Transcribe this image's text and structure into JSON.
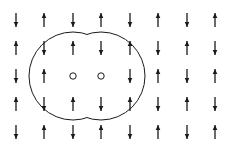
{
  "diagram": {
    "rows": 5,
    "cols": 8,
    "grid": [
      [
        "down",
        "up",
        "down",
        "up",
        "down",
        "up",
        "down",
        "up"
      ],
      [
        "up",
        "down",
        "up",
        "down",
        "up",
        "down",
        "up",
        "down"
      ],
      [
        "down",
        "up",
        "hole",
        "hole",
        "down",
        "up",
        "down",
        "up"
      ],
      [
        "up",
        "down",
        "up",
        "down",
        "up",
        "down",
        "up",
        "down"
      ],
      [
        "down",
        "up",
        "down",
        "up",
        "down",
        "up",
        "down",
        "up"
      ]
    ],
    "col_x": [
      16,
      44,
      73,
      101,
      130,
      158,
      187,
      215
    ],
    "row_y": [
      20,
      48,
      76,
      104,
      132
    ],
    "boundary": {
      "circles": [
        {
          "cx": 73,
          "cy": 76,
          "r": 44
        },
        {
          "cx": 101,
          "cy": 76,
          "r": 44
        }
      ]
    },
    "colors": {
      "stroke": "#1a1a1a",
      "background": "#ffffff"
    },
    "icons": {
      "up": "arrow-up-icon",
      "down": "arrow-down-icon",
      "hole": "open-circle-icon"
    }
  }
}
